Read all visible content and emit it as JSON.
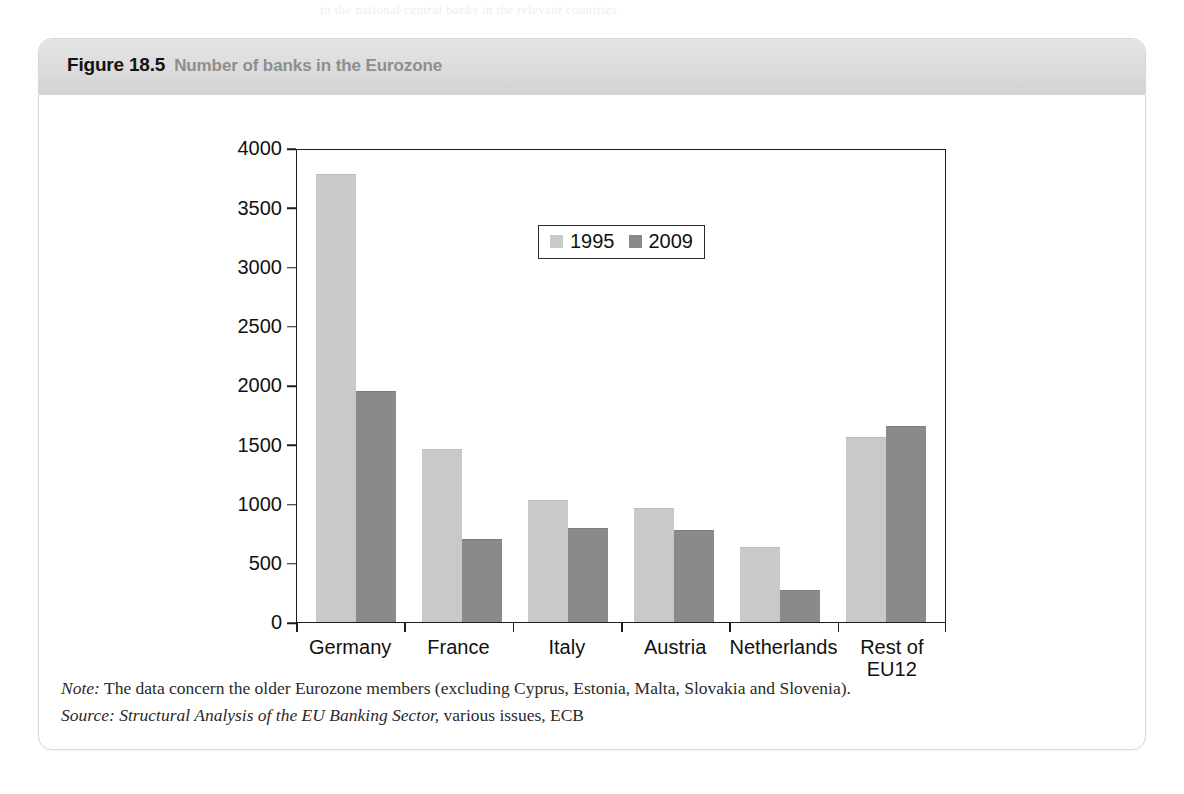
{
  "figure": {
    "number_label": "Figure 18.5",
    "title": "Number of banks in the Eurozone",
    "note_lead": "Note:",
    "note_text": " The data concern the older Eurozone members (excluding Cyprus, Estonia, Malta, Slovakia and Slovenia).",
    "source_lead": "Source:",
    "source_title": " Structural Analysis of the EU Banking Sector,",
    "source_rest": " various issues, ECB"
  },
  "colors": {
    "series_1995": "#c9c9c9",
    "series_2009": "#8a8a8a",
    "axis": "#1d1d1d",
    "header_text": "#8e8e8e",
    "figure_number_text": "#141414"
  },
  "chart_data": {
    "type": "bar",
    "title": "Number of banks in the Eurozone",
    "xlabel": "",
    "ylabel": "",
    "ylim": [
      0,
      4000
    ],
    "yticks": [
      0,
      500,
      1000,
      1500,
      2000,
      2500,
      3000,
      3500,
      4000
    ],
    "ytick_labels": [
      "0",
      "500",
      "1000",
      "1500",
      "2000",
      "2500",
      "3000",
      "3500",
      "4000"
    ],
    "grid": false,
    "legend_position": "upper center",
    "categories": [
      "Germany",
      "France",
      "Italy",
      "Austria",
      "Netherlands",
      "Rest of\nEU12"
    ],
    "category_labels": [
      "Germany",
      "France",
      "Italy",
      "Austria",
      "Netherlands",
      "Rest of EU12"
    ],
    "series": [
      {
        "name": "1995",
        "color": "#c9c9c9",
        "values": [
          3780,
          1460,
          1030,
          960,
          630,
          1560
        ]
      },
      {
        "name": "2009",
        "color": "#8a8a8a",
        "values": [
          1950,
          700,
          790,
          775,
          270,
          1650
        ]
      }
    ]
  },
  "bleed": {
    "top_text": "to the national central banks in the relevant countries",
    "header_text": "the risks to financial stability in the banking sector"
  }
}
